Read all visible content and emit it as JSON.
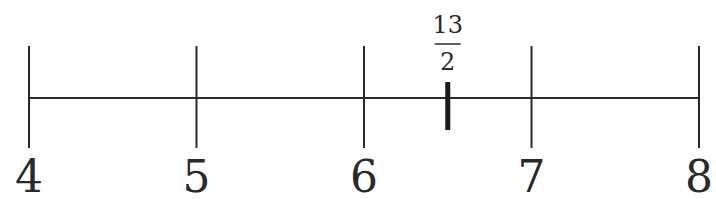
{
  "chart_data": {
    "type": "number-line",
    "range": [
      4,
      8
    ],
    "ticks": [
      {
        "value": 4,
        "label": "4"
      },
      {
        "value": 5,
        "label": "5"
      },
      {
        "value": 6,
        "label": "6"
      },
      {
        "value": 7,
        "label": "7"
      },
      {
        "value": 8,
        "label": "8"
      }
    ],
    "marked_point": {
      "value": 6.5,
      "numerator": "13",
      "denominator": "2"
    },
    "line_color": "#2a2a2a"
  }
}
